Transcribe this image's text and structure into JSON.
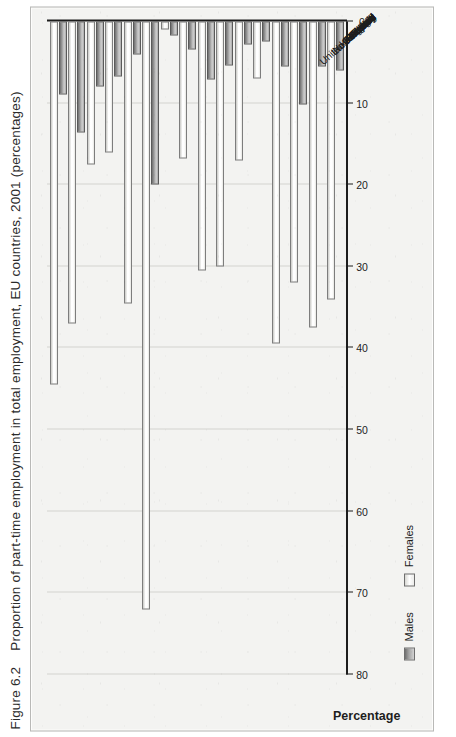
{
  "figure": {
    "number": "Figure 6.2",
    "caption": "Proportion of part-time employment in total employment, EU countries, 2001 (percentages)"
  },
  "legend": {
    "position": "bottom-left",
    "items": [
      {
        "label": "Males",
        "color": "#8f8f8f"
      },
      {
        "label": "Females",
        "color": "#ffffff"
      }
    ]
  },
  "axis": {
    "value_title": "Percentage",
    "tick_labels": [
      "80",
      "70",
      "60",
      "50",
      "40",
      "30",
      "20",
      "10",
      "0"
    ]
  },
  "chart_data": {
    "type": "bar",
    "title": "Proportion of part-time employment in total employment, EU countries, 2001 (percentages)",
    "orientation": "horizontal",
    "xlabel": "Percentage",
    "ylabel": "",
    "xlim": [
      0,
      80
    ],
    "xticks": [
      0,
      10,
      20,
      30,
      40,
      50,
      60,
      70,
      80
    ],
    "grid": true,
    "legend_position": "bottom-left",
    "categories": [
      "EU-15",
      "Belgium",
      "Denmark",
      "Germany",
      "Greece",
      "Spain",
      "France",
      "Ireland",
      "Italy",
      "Luxembourg",
      "Netherlands",
      "Austria",
      "Portugal",
      "Finland",
      "Sweden",
      "United Kingdom"
    ],
    "series": [
      {
        "name": "Males",
        "color": "#8f8f8f",
        "values": [
          6.0,
          5.5,
          10.2,
          5.5,
          2.5,
          2.8,
          5.4,
          7.1,
          3.4,
          1.7,
          20.0,
          4.1,
          6.7,
          8.0,
          13.6,
          9.0
        ]
      },
      {
        "name": "Females",
        "color": "#ffffff",
        "values": [
          34.0,
          37.5,
          32.0,
          39.5,
          7.0,
          17.0,
          30.0,
          30.5,
          16.8,
          1.0,
          72.0,
          34.5,
          16.0,
          17.5,
          37.0,
          44.5
        ]
      }
    ]
  }
}
